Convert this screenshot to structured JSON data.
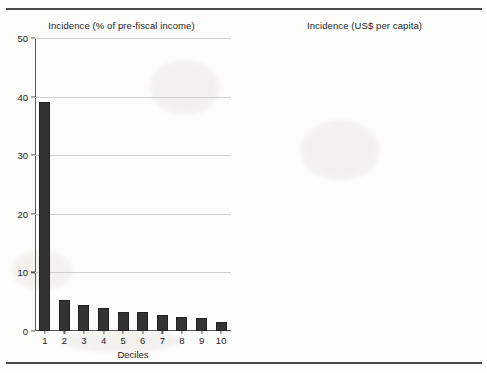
{
  "figure": {
    "xaxis_title": "Deciles"
  },
  "chart_data": [
    {
      "type": "bar",
      "title": "Incidence (% of pre-fiscal income)",
      "xlabel": "Deciles",
      "ylabel": "",
      "categories": [
        "1",
        "2",
        "3",
        "4",
        "5",
        "6",
        "7",
        "8",
        "9",
        "10"
      ],
      "values": [
        39,
        5.3,
        4.4,
        3.9,
        3.2,
        3.2,
        2.7,
        2.4,
        2.3,
        1.5
      ],
      "ylim": [
        0,
        50
      ],
      "yticks": [
        0,
        10,
        20,
        30,
        40,
        50
      ],
      "ytick_labels": [
        "0",
        "10",
        "20",
        "30",
        "40",
        "50"
      ],
      "grid": true,
      "legend": false,
      "bar_color": "#333333"
    },
    {
      "type": "bar",
      "title": "Incidence (US$ per capita)",
      "xlabel": "Deciles",
      "ylabel": "",
      "categories": [
        "1",
        "2",
        "3",
        "4",
        "5",
        "6",
        "7",
        "8",
        "9",
        "10"
      ],
      "values": [
        0.65,
        0.35,
        0.45,
        0.51,
        0.52,
        0.65,
        0.68,
        0.76,
        0.99,
        1.24
      ],
      "ylim": [
        0,
        1.5
      ],
      "yticks": [
        0,
        0.3,
        0.6,
        0.9,
        1.2,
        1.5
      ],
      "ytick_labels": [
        "0",
        "0.3",
        "0.6",
        "0.9",
        "1.2",
        "1.5"
      ],
      "grid": true,
      "legend": false,
      "bar_color": "#333333"
    }
  ]
}
